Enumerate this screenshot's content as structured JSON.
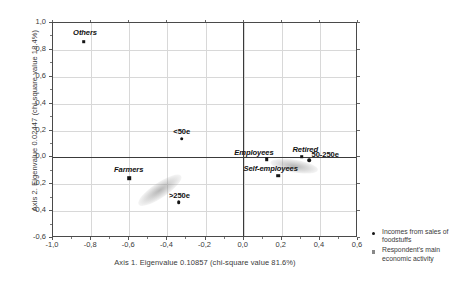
{
  "chart_data": {
    "type": "scatter",
    "title": "",
    "xlabel": "Axis 1. Eigenvalue 0.10857 (chi-square value 81.6%)",
    "ylabel": "Axis 2. Eigenvalue 0.02447 (chi-square value 18.4%)",
    "xlim": [
      -1.0,
      0.6
    ],
    "ylim": [
      -0.6,
      1.0
    ],
    "xticks": [
      "-1,0",
      "-0,8",
      "-0,6",
      "-0,4",
      "-0,2",
      "0,0",
      "0,2",
      "0,4",
      "0,6"
    ],
    "xtick_values": [
      -1.0,
      -0.8,
      -0.6,
      -0.4,
      -0.2,
      0.0,
      0.2,
      0.4,
      0.6
    ],
    "yticks": [
      "1,0",
      "0,8",
      "0,6",
      "0,4",
      "0,2",
      "0,0",
      "-0,2",
      "-0,4",
      "-0,6"
    ],
    "ytick_values": [
      1.0,
      0.8,
      0.6,
      0.4,
      0.2,
      0.0,
      -0.2,
      -0.4,
      -0.6
    ],
    "grid": true,
    "legend_position": "right-bottom",
    "series": [
      {
        "name": "Incomes from sales of foodstuffs",
        "marker": "circle",
        "points": [
          {
            "label": "<50e",
            "x": -0.325,
            "y": 0.14,
            "label_dx": 0,
            "label_dy": 0.055
          },
          {
            "label": ">250e",
            "x": -0.34,
            "y": -0.335,
            "label_dx": 0.003,
            "label_dy": 0.055
          },
          {
            "label": "50-250e",
            "x": 0.345,
            "y": -0.02,
            "label_dx": 0.083,
            "label_dy": 0.048
          }
        ]
      },
      {
        "name": "Respondent's main economic activity",
        "marker": "square",
        "points": [
          {
            "label": "Others",
            "x": -0.84,
            "y": 0.86,
            "label_dx": 0.008,
            "label_dy": 0.072
          },
          {
            "label": "Farmers",
            "x": -0.6,
            "y": -0.155,
            "label_dx": -0.003,
            "label_dy": 0.07
          },
          {
            "label": "Employees",
            "x": 0.122,
            "y": -0.015,
            "label_dx": -0.068,
            "label_dy": 0.055
          },
          {
            "label": "Self-employees",
            "x": 0.18,
            "y": -0.135,
            "label_dx": -0.038,
            "label_dy": 0.055
          },
          {
            "label": "Retired",
            "x": 0.305,
            "y": 0.005,
            "label_dx": 0.018,
            "label_dy": 0.058
          }
        ]
      }
    ],
    "smudges": [
      {
        "x": -0.44,
        "y": -0.245,
        "w": 0.27,
        "h": 0.11,
        "rot": -34
      },
      {
        "x": 0.265,
        "y": -0.065,
        "w": 0.25,
        "h": 0.095,
        "rot": 9
      }
    ]
  },
  "legend": {
    "items": [
      {
        "marker": "circle",
        "label": "Incomes from sales of foodstuffs"
      },
      {
        "marker": "square",
        "label": "Respondent's main economic activity"
      }
    ]
  }
}
